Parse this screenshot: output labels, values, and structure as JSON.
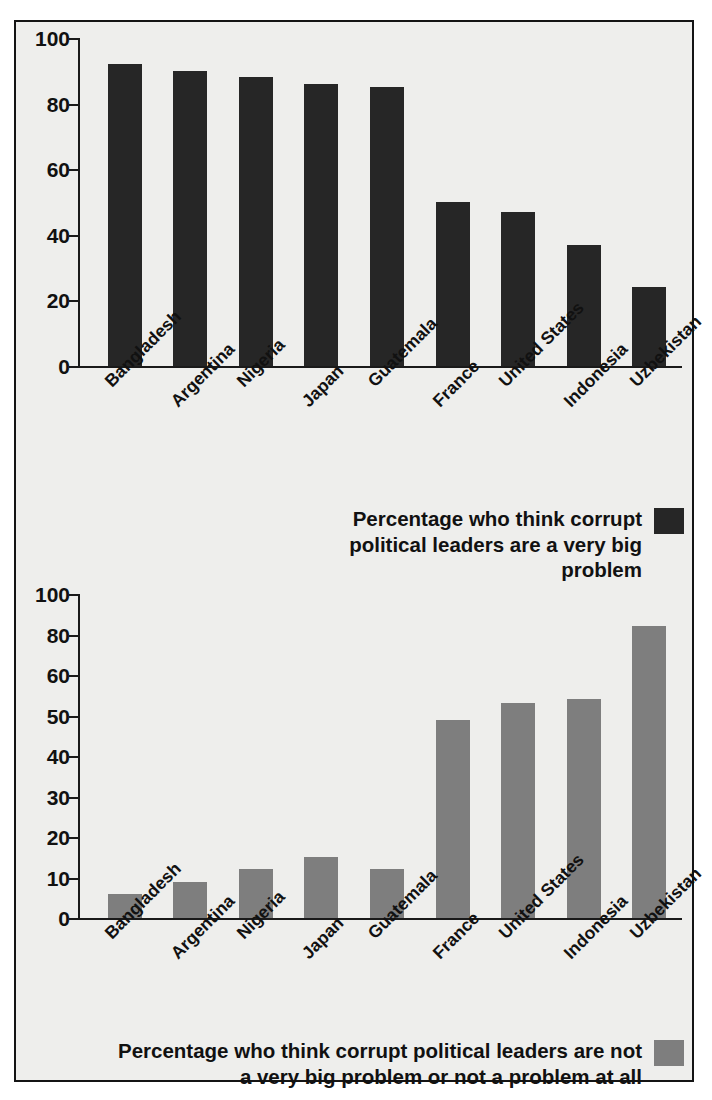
{
  "chart_data": [
    {
      "type": "bar",
      "title": "",
      "xlabel": "",
      "ylabel": "",
      "ylim": [
        0,
        100
      ],
      "grid": false,
      "legend_position": "below-right",
      "bar_color": "#262626",
      "legend": "Percentage who think corrupt\npolitical leaders are a very big problem",
      "categories": [
        "Bangladesh",
        "Argentina",
        "Nigeria",
        "Japan",
        "Guatemala",
        "France",
        "United States",
        "Indonesia",
        "Uzbekistan"
      ],
      "values": [
        92,
        90,
        88,
        86,
        85,
        50,
        47,
        37,
        24
      ],
      "yticks": [
        0,
        20,
        40,
        60,
        80,
        100
      ],
      "ytick_labels": [
        "0",
        "20",
        "40",
        "60",
        "80",
        "100"
      ]
    },
    {
      "type": "bar",
      "title": "",
      "xlabel": "",
      "ylabel": "",
      "ylim": [
        0,
        100
      ],
      "grid": false,
      "legend_position": "below-right",
      "bar_color": "#7e7e7e",
      "legend": "Percentage who think corrupt political leaders are not\na very big problem or not a problem at all",
      "categories": [
        "Bangladesh",
        "Argentina",
        "Nigeria",
        "Japan",
        "Guatemala",
        "France",
        "United States",
        "Indonesia",
        "Uzbekistan"
      ],
      "values": [
        6,
        9,
        12,
        15,
        12,
        49,
        53,
        54,
        84
      ],
      "yticks": [
        0,
        10,
        20,
        30,
        40,
        50,
        60,
        80,
        100
      ],
      "ytick_labels": [
        "0",
        "10",
        "20",
        "30",
        "40",
        "50",
        "60",
        "80",
        "100"
      ]
    }
  ]
}
